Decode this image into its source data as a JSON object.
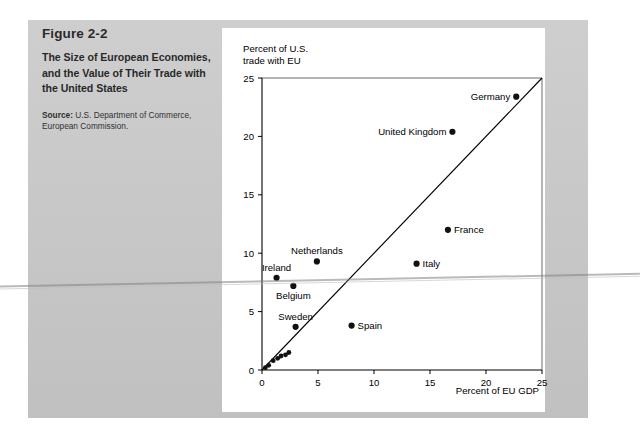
{
  "figure": {
    "number": "Figure 2-2",
    "title": "The Size of European Economies, and the Value of Their Trade with the United States",
    "source_label": "Source:",
    "source_text": " U.S. Department of Commerce, European Commission."
  },
  "chart_data": {
    "type": "scatter",
    "title": "",
    "xlabel": "Percent of EU GDP",
    "ylabel": "Percent of U.S.\ntrade with EU",
    "xlim": [
      0,
      25
    ],
    "ylim": [
      0,
      25
    ],
    "xticks": [
      0,
      5,
      10,
      15,
      20,
      25
    ],
    "yticks": [
      0,
      5,
      10,
      15,
      20,
      25
    ],
    "xtick_labels": [
      "0",
      "5",
      "10",
      "15",
      "20",
      "25"
    ],
    "ytick_labels": [
      "0",
      "5",
      "10",
      "15",
      "20",
      "25"
    ],
    "grid": false,
    "legend": null,
    "reference_line": {
      "name": "45-degree line",
      "from": [
        0,
        0
      ],
      "to": [
        25,
        25
      ]
    },
    "points": [
      {
        "label": "Germany",
        "x": 22.7,
        "y": 23.4,
        "label_pos": "left"
      },
      {
        "label": "United Kingdom",
        "x": 17.0,
        "y": 20.4,
        "label_pos": "left"
      },
      {
        "label": "France",
        "x": 16.6,
        "y": 12.0,
        "label_pos": "right"
      },
      {
        "label": "Italy",
        "x": 13.8,
        "y": 9.1,
        "label_pos": "right"
      },
      {
        "label": "Netherlands",
        "x": 4.9,
        "y": 9.3,
        "label_pos": "above"
      },
      {
        "label": "Ireland",
        "x": 1.3,
        "y": 7.9,
        "label_pos": "above"
      },
      {
        "label": "Belgium",
        "x": 2.8,
        "y": 7.2,
        "label_pos": "below"
      },
      {
        "label": "Sweden",
        "x": 3.0,
        "y": 3.7,
        "label_pos": "above"
      },
      {
        "label": "Spain",
        "x": 8.0,
        "y": 3.8,
        "label_pos": "right"
      },
      {
        "label": "",
        "x": 2.4,
        "y": 1.5,
        "label_pos": "none"
      },
      {
        "label": "",
        "x": 2.1,
        "y": 1.3,
        "label_pos": "none"
      },
      {
        "label": "",
        "x": 1.7,
        "y": 1.2,
        "label_pos": "none"
      },
      {
        "label": "",
        "x": 1.4,
        "y": 1.0,
        "label_pos": "none"
      },
      {
        "label": "",
        "x": 1.0,
        "y": 0.8,
        "label_pos": "none"
      },
      {
        "label": "",
        "x": 0.6,
        "y": 0.4,
        "label_pos": "none"
      },
      {
        "label": "",
        "x": 0.3,
        "y": 0.2,
        "label_pos": "none"
      }
    ]
  },
  "colors": {
    "panel_background": "#c9c9c9",
    "chart_background": "#ffffff",
    "ink": "#000000",
    "point_fill": "#111111"
  }
}
